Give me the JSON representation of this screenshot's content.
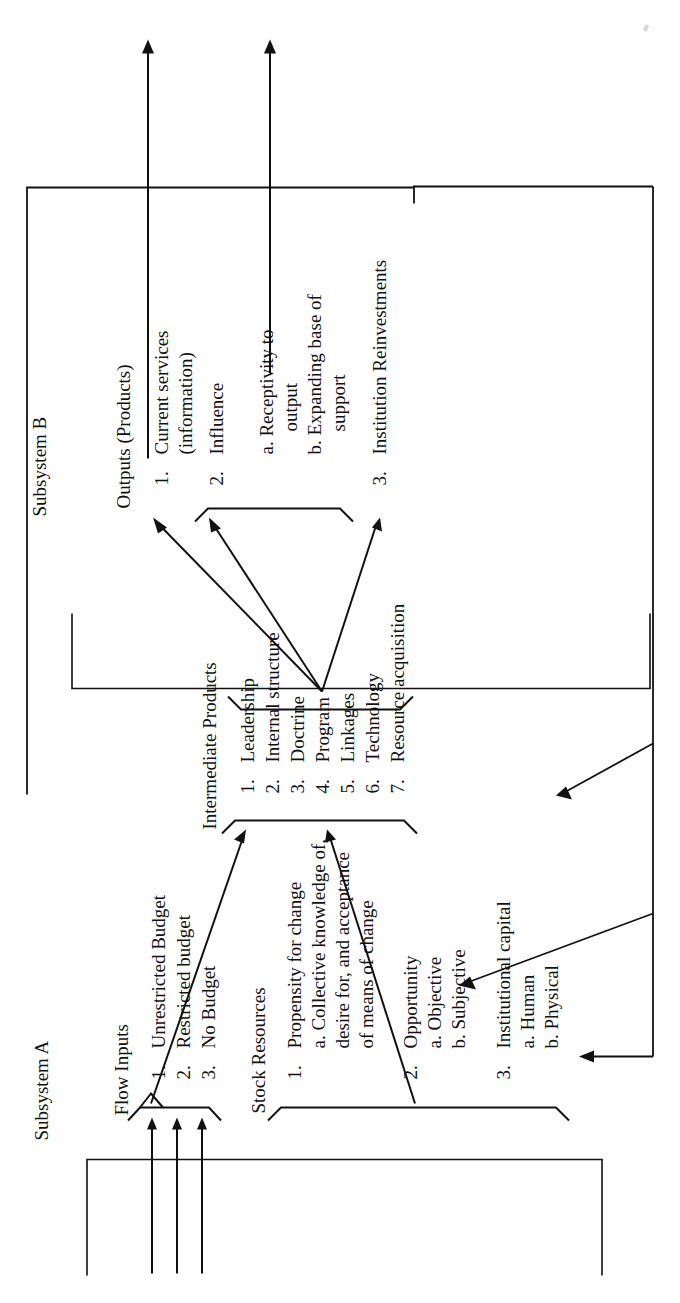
{
  "diagram": {
    "subsystems": [
      {
        "id": "A",
        "label": "Subsystem A"
      },
      {
        "id": "B",
        "label": "Subsystem B"
      }
    ],
    "sections": [
      {
        "id": "flow-inputs",
        "heading": "Flow Inputs",
        "items": [
          {
            "num": "1.",
            "text": "Unrestricted Budget"
          },
          {
            "num": "2.",
            "text": "Restricted budget"
          },
          {
            "num": "3.",
            "text": "No Budget"
          }
        ]
      },
      {
        "id": "stock-resources",
        "heading": "Stock Resources",
        "items": [
          {
            "num": "1.",
            "text": "Propensity for change",
            "subs": [
              "a. Collective knowledge of,",
              "desire for, and acceptance",
              "of means of change"
            ]
          },
          {
            "num": "2.",
            "text": "Opportunity",
            "subs": [
              "a. Objective",
              "b. Subjective"
            ]
          },
          {
            "num": "3.",
            "text": "Institutional capital",
            "subs": [
              "a. Human",
              "b. Physical"
            ]
          }
        ]
      },
      {
        "id": "intermediate-products",
        "heading": "Intermediate Products",
        "items": [
          {
            "num": "1.",
            "text": "Leadership"
          },
          {
            "num": "2.",
            "text": "Internal structure"
          },
          {
            "num": "3.",
            "text": "Doctrine"
          },
          {
            "num": "4.",
            "text": "Program"
          },
          {
            "num": "5.",
            "text": "Linkages"
          },
          {
            "num": "6.",
            "text": "Technology"
          },
          {
            "num": "7.",
            "text": "Resource acquisition"
          }
        ]
      },
      {
        "id": "outputs",
        "heading": "Outputs (Products)",
        "items": [
          {
            "num": "1.",
            "text": "Current services",
            "subs": [
              "(information)"
            ]
          },
          {
            "num": "2.",
            "text": "Influence",
            "subs": [
              "a. Receptivity to",
              "output",
              "b. Expanding base of",
              "support"
            ]
          },
          {
            "num": "3.",
            "text": "Institution Reinvestments"
          }
        ]
      }
    ],
    "colors": {
      "ink": "#111111",
      "paper": "#ffffff"
    }
  }
}
